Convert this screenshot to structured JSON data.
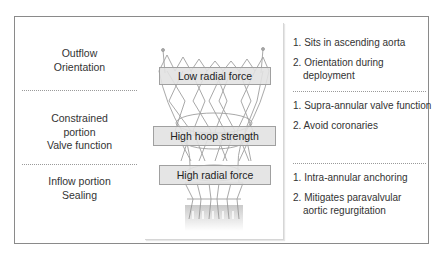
{
  "diagram": {
    "rows": [
      {
        "region_lines": [
          "Outflow",
          "Orientation"
        ],
        "frame_property": "Low radial force",
        "points": [
          {
            "num": "1.",
            "text": "Sits in ascending aorta",
            "cont": ""
          },
          {
            "num": "2.",
            "text": "Orientation during",
            "cont": "deployment"
          }
        ]
      },
      {
        "region_lines": [
          "Constrained",
          "portion",
          "Valve function"
        ],
        "frame_property": "High hoop strength",
        "points": [
          {
            "num": "1.",
            "text": "Supra-annular valve function",
            "cont": ""
          },
          {
            "num": "2.",
            "text": "Avoid coronaries",
            "cont": ""
          }
        ]
      },
      {
        "region_lines": [
          "Inflow portion",
          "Sealing"
        ],
        "frame_property": "High radial force",
        "points": [
          {
            "num": "1.",
            "text": "Intra-annular anchoring",
            "cont": ""
          },
          {
            "num": "2.",
            "text": "Mitigates paravalvular",
            "cont": "aortic regurgitation"
          }
        ]
      }
    ],
    "image": {
      "subject": "self-expanding transcatheter aortic valve stent frame"
    },
    "colors": {
      "border": "#8a8a8a",
      "label_fill": "#e1e1e1",
      "divider": "#9a9a9a",
      "text": "#333333"
    }
  }
}
